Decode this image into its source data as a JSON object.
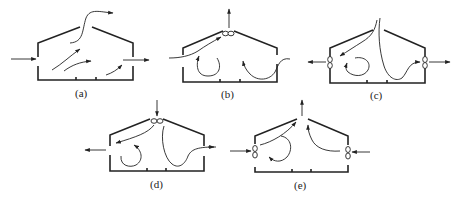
{
  "figure": {
    "panels": [
      {
        "id": "a",
        "label": "(a)",
        "description": "Natural ventilation: inlet at left wall, outlet at right wall and ridge opening"
      },
      {
        "id": "b",
        "label": "(b)",
        "description": "Ridge exhaust fan with air entering side wall openings"
      },
      {
        "id": "c",
        "label": "(c)",
        "description": "Side wall exhaust fans with air entering through ridge"
      },
      {
        "id": "d",
        "label": "(d)",
        "description": "Ridge supply fan with air exiting side wall openings"
      },
      {
        "id": "e",
        "label": "(e)",
        "description": "Side wall supply fans with air exiting through ridge"
      }
    ],
    "colors": {
      "line": "#222222",
      "background": "#ffffff"
    }
  }
}
